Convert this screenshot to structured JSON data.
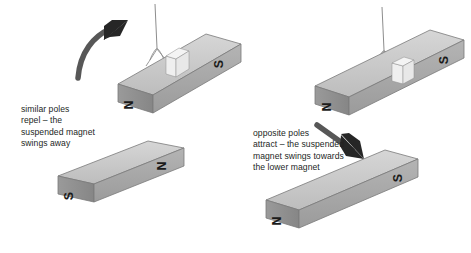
{
  "figure": {
    "kind": "physics-diagram",
    "background_color": "#ffffff"
  },
  "panels": [
    {
      "id": "repulsion",
      "caption": "similar poles\nrepel – the\nsuspended magnet\nswings away",
      "arrow": {
        "name": "repel-arrow",
        "direction": "curved-up-left-to-right",
        "color": "#262626"
      },
      "magnets": [
        {
          "name": "suspended-magnet-left",
          "suspended": true,
          "thread": true,
          "left_pole": "N",
          "right_pole": "S"
        },
        {
          "name": "lower-magnet-left",
          "suspended": false,
          "thread": false,
          "left_pole": "S",
          "right_pole": "N"
        }
      ]
    },
    {
      "id": "attraction",
      "caption": "opposite poles\nattract – the suspended\nmagnet swings towards\nthe lower magnet",
      "arrow": {
        "name": "attract-arrow",
        "direction": "curved-down-to-lower-right",
        "color": "#262626"
      },
      "magnets": [
        {
          "name": "suspended-magnet-right",
          "suspended": true,
          "thread": true,
          "left_pole": "N",
          "right_pole": "S"
        },
        {
          "name": "lower-magnet-right",
          "suspended": false,
          "thread": false,
          "left_pole": "N",
          "right_pole": "S"
        }
      ]
    }
  ],
  "labels": {
    "north": "N",
    "south": "S"
  },
  "colors": {
    "magnet_top": "#c9c9c9",
    "magnet_front": "#a8a8a8",
    "magnet_end": "#8f8f8f",
    "magnet_band": "#efefef",
    "outline": "#6e6e6e",
    "text": "#231f1e",
    "arrow": "#262626",
    "thread": "#9a9a9a"
  }
}
